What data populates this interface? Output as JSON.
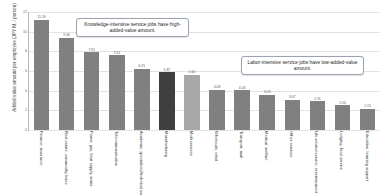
{
  "chart_data": {
    "type": "bar",
    "title": "",
    "xlabel": "",
    "ylabel": "Added-value amount per employee (JPY M. / person)",
    "ylim": [
      0,
      12
    ],
    "yticks": [
      "12",
      "10",
      "8",
      "6",
      "4",
      "2",
      "0"
    ],
    "grid": true,
    "legend": "none",
    "categories": [
      "Finance, insurance",
      "Real estate, commodity lease",
      "Power, gas, heat supply, water",
      "Telecommunication",
      "Academic, specialized/technical services",
      "Manufacturing",
      "Multi services",
      "Wholesale, retail",
      "Transport, mail",
      "Medical, welfare",
      "Other services",
      "Life-related service, entertainment",
      "Lodging, food service",
      "Education, learning support"
    ],
    "values": [
      11.19,
      9.4,
      7.91,
      7.61,
      6.25,
      5.87,
      5.6,
      4.08,
      4.03,
      3.59,
      3.07,
      2.91,
      2.5,
      2.15
    ],
    "value_labels": [
      "11.19",
      "9.40",
      "7.91",
      "7.61",
      "6.25",
      "5.87",
      "5.60",
      "4.08",
      "4.03",
      "3.59",
      "3.07",
      "2.91",
      "2.50",
      "2.15"
    ],
    "bar_styles": [
      "normal",
      "normal",
      "normal",
      "normal",
      "normal",
      "dark",
      "light",
      "normal",
      "normal",
      "normal",
      "normal",
      "normal",
      "normal",
      "normal"
    ],
    "annotations": [
      {
        "id": "knowledge",
        "text": "Knowledge-intensive service jobs have high-added-value amount."
      },
      {
        "id": "labor",
        "text": "Labor-intensive service jobs have low-added-value amount."
      }
    ]
  },
  "colors": {
    "bar_normal": "#808080",
    "bar_dark": "#3f3f3f",
    "bar_light": "#a8a8a8",
    "grid": "#e3e3e3",
    "axis": "#b8b8b8",
    "callout_border": "#9aa4b0",
    "text": "#333333"
  }
}
